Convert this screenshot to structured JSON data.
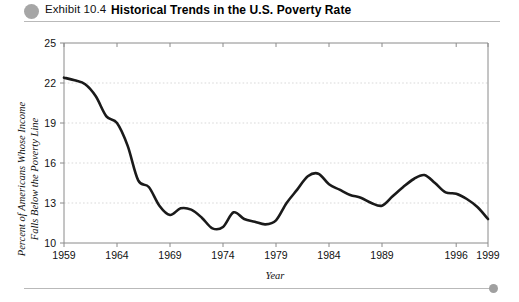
{
  "header": {
    "bullet_icon": "exhibit-bullet-circle",
    "exhibit_label": "Exhibit 10.4",
    "title": "Historical Trends in the U.S. Poverty Rate"
  },
  "footer": {
    "bullet_icon": "footer-bullet-circle"
  },
  "colors": {
    "line": "#1a1a1a",
    "grid": "#cfcfcf",
    "frame": "#8a8a8a",
    "bullet": "#a6a6a6",
    "rule": "#b9b9b9"
  },
  "chart_data": {
    "type": "line",
    "title": "Historical Trends in the U.S. Poverty Rate",
    "xlabel": "Year",
    "ylabel": "Percent of Americans Whose Income Falls Below the Poverty Line",
    "ylabel_line1": "Percent of Americans Whose Income",
    "ylabel_line2": "Falls Below the Poverty Line",
    "xlim": [
      1959,
      1999
    ],
    "ylim": [
      10,
      25
    ],
    "ytick_values": [
      25,
      22,
      19,
      16,
      13,
      10
    ],
    "ytick_labels": [
      "25",
      "22",
      "19",
      "16",
      "13",
      "10"
    ],
    "xtick_values": [
      1959,
      1964,
      1969,
      1974,
      1979,
      1984,
      1989,
      1996,
      1999
    ],
    "xtick_labels": [
      "1959",
      "1964",
      "1969",
      "1974",
      "1979",
      "1984",
      "1989",
      "1996",
      "1999"
    ],
    "grid": "horizontal-dashed",
    "legend": "none",
    "x": [
      1959,
      1960,
      1961,
      1962,
      1963,
      1964,
      1965,
      1966,
      1967,
      1968,
      1969,
      1970,
      1971,
      1972,
      1973,
      1974,
      1975,
      1976,
      1977,
      1978,
      1979,
      1980,
      1981,
      1982,
      1983,
      1984,
      1985,
      1986,
      1987,
      1988,
      1989,
      1990,
      1991,
      1992,
      1993,
      1994,
      1995,
      1996,
      1997,
      1998,
      1999
    ],
    "values": [
      22.4,
      22.2,
      21.9,
      21.0,
      19.5,
      19.0,
      17.3,
      14.7,
      14.2,
      12.8,
      12.1,
      12.6,
      12.5,
      11.9,
      11.1,
      11.2,
      12.3,
      11.8,
      11.6,
      11.4,
      11.7,
      13.0,
      14.0,
      15.0,
      15.2,
      14.4,
      14.0,
      13.6,
      13.4,
      13.0,
      12.8,
      13.5,
      14.2,
      14.8,
      15.1,
      14.5,
      13.8,
      13.7,
      13.3,
      12.7,
      11.8
    ],
    "series_name": "U.S. Poverty Rate"
  }
}
